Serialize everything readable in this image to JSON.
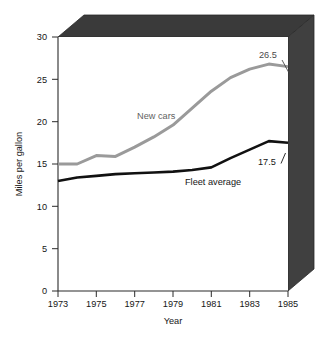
{
  "chart_data": {
    "type": "line",
    "title": "",
    "xlabel": "Year",
    "ylabel": "Miles per gallon",
    "xlim": [
      1973,
      1985
    ],
    "ylim": [
      0,
      30
    ],
    "grid": false,
    "legend_position": "inline-labels",
    "x_ticks": [
      "1973",
      "1975",
      "1977",
      "1979",
      "1981",
      "1983",
      "1985"
    ],
    "y_ticks": [
      "0",
      "5",
      "10",
      "15",
      "20",
      "25",
      "30"
    ],
    "x": [
      1973,
      1974,
      1975,
      1976,
      1977,
      1978,
      1979,
      1980,
      1981,
      1982,
      1983,
      1984,
      1985
    ],
    "series": [
      {
        "name": "New cars",
        "color": "#9a9a9a",
        "values": [
          15.0,
          15.0,
          16.0,
          15.9,
          17.0,
          18.2,
          19.6,
          21.6,
          23.6,
          25.2,
          26.2,
          26.8,
          26.5
        ],
        "end_value_label": "26.5"
      },
      {
        "name": "Fleet average",
        "color": "#111111",
        "values": [
          13.0,
          13.4,
          13.6,
          13.8,
          13.9,
          14.0,
          14.1,
          14.3,
          14.6,
          15.7,
          16.7,
          17.7,
          17.5
        ],
        "end_value_label": "17.5"
      }
    ],
    "annotations": [
      {
        "text": "26.5",
        "series": "New cars",
        "x": 1985
      },
      {
        "text": "17.5",
        "series": "Fleet average",
        "x": 1985
      },
      {
        "text": "New cars",
        "series": "New cars"
      },
      {
        "text": "Fleet average",
        "series": "Fleet average"
      }
    ],
    "frame": {
      "style": "3d-block",
      "top_face_color": "#3a3a3a",
      "side_face_color": "#3f3f3f"
    }
  }
}
